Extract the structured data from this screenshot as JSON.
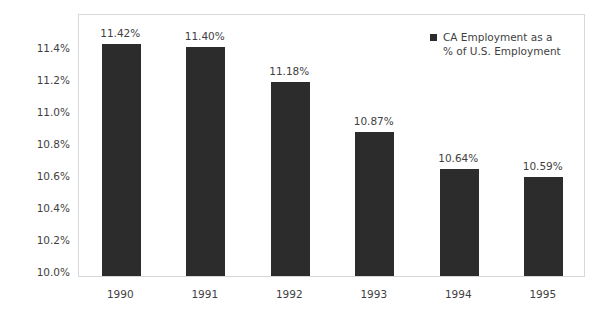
{
  "chart_data": {
    "type": "bar",
    "title": "",
    "subtitle": "",
    "xlabel": "",
    "ylabel": "",
    "categories": [
      "1990",
      "1991",
      "1992",
      "1993",
      "1994",
      "1995"
    ],
    "values": [
      11.42,
      11.4,
      11.18,
      10.87,
      10.64,
      10.59
    ],
    "data_labels": [
      "11.42%",
      "11.40%",
      "11.18%",
      "10.87%",
      "10.64%",
      "10.59%"
    ],
    "series": [
      {
        "name": "CA Employment as a % of U.S. Employment",
        "values": [
          11.42,
          11.4,
          11.18,
          10.87,
          10.64,
          10.59
        ],
        "color": "#2c2c2c"
      }
    ],
    "ylim": [
      10.0,
      11.4
    ],
    "ytick_values": [
      11.4,
      11.2,
      11.0,
      10.8,
      10.6,
      10.4,
      10.2,
      10.0
    ],
    "ytick_labels": [
      "11.4%",
      "11.2%",
      "11.0%",
      "10.8%",
      "10.6%",
      "10.4%",
      "10.2%",
      "10.0%"
    ],
    "grid": false,
    "legend_position": "top-right",
    "legend": [
      "CA Employment as a\n% of U.S. Employment"
    ],
    "plot_border_color": "#d8d8d8",
    "background_color": "#ffffff"
  },
  "legend": {
    "label": "CA Employment as a\n% of U.S. Employment",
    "swatch_color": "#2c2c2c"
  }
}
